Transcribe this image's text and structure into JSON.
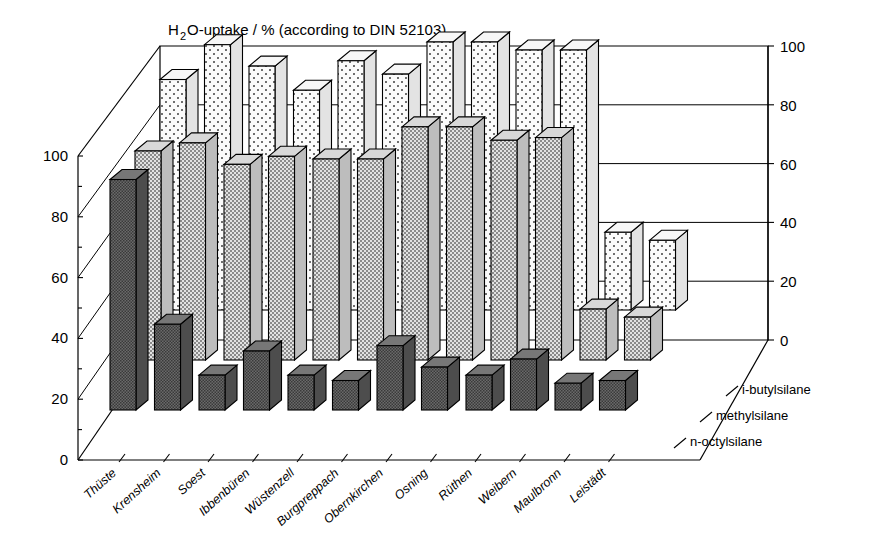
{
  "chart_data": {
    "type": "bar",
    "subtype": "3d-grouped-bar",
    "title_rich": {
      "pre": "H",
      "sub": "2",
      "post": "O-uptake / %  (according to DIN 52103)"
    },
    "xlabel": "",
    "ylabel": "",
    "ylim": [
      0,
      100
    ],
    "yticks": [
      0,
      20,
      40,
      60,
      80,
      100
    ],
    "yticks_minor": [
      10,
      30,
      50,
      70,
      90
    ],
    "left_axis_labels": [
      "0",
      "20",
      "40",
      "60",
      "80",
      "100"
    ],
    "right_axis_labels": [
      "0",
      "20",
      "40",
      "60",
      "80",
      "100"
    ],
    "grid": true,
    "legend_position": "depth-axis-right",
    "categories": [
      "Thüste",
      "Krensheim",
      "Soest",
      "Ibbenbüren",
      "Wüstenzell",
      "Burgpreppach",
      "Obernkirchen",
      "Osning",
      "Rüthen",
      "Weibern",
      "Maulbronn",
      "Leistädt"
    ],
    "series": [
      {
        "name": "i-butylsilane",
        "depth_row": 0,
        "values": [
          86,
          99,
          91,
          82,
          93,
          88,
          100,
          100,
          97,
          97,
          29,
          26
        ]
      },
      {
        "name": "methylsilane",
        "depth_row": 1,
        "values": [
          78,
          81,
          73,
          76,
          75,
          75,
          87,
          87,
          82,
          83,
          19,
          16
        ]
      },
      {
        "name": "n-octylsilane",
        "depth_row": 2,
        "values": [
          86,
          32,
          13,
          22,
          13,
          11,
          24,
          16,
          13,
          19,
          10,
          11
        ]
      }
    ],
    "series_names": [
      "i-butylsilane",
      "methylsilane",
      "n-octylsilane"
    ],
    "colors": {
      "series_i_butylsilane_fill": "#f4f4f4",
      "series_methylsilane_fill": "#d5d5d5",
      "series_n_octylsilane_fill": "#6e6e6e",
      "axis": "#000000",
      "background": "#ffffff"
    }
  },
  "axes": {
    "left_title": "",
    "right_title": ""
  }
}
